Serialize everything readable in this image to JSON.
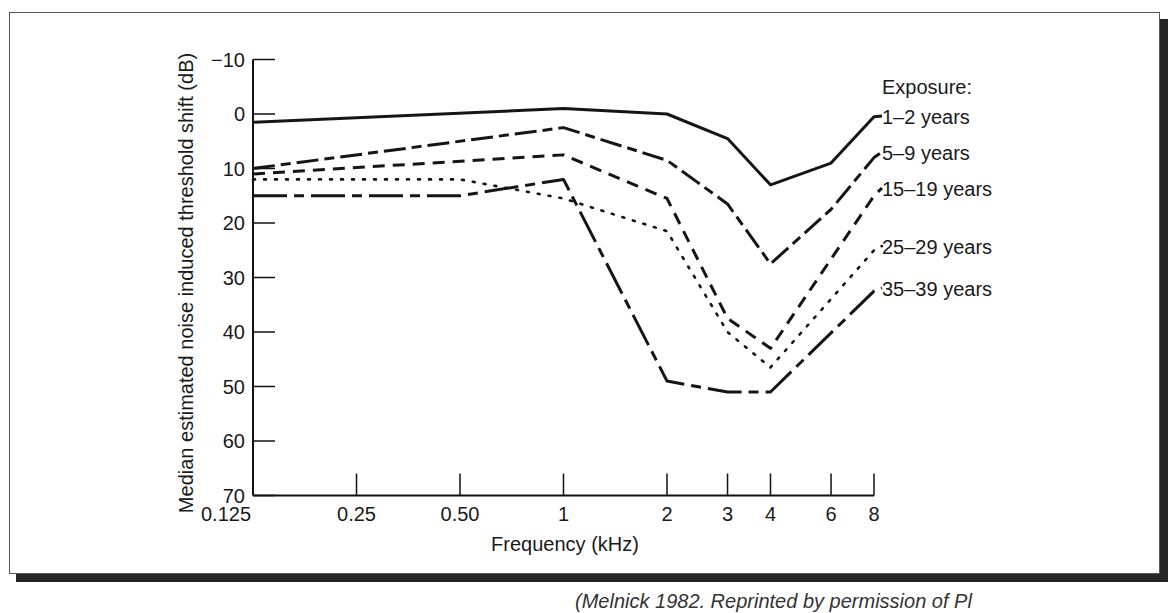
{
  "figure": {
    "title_partial": "Figure: Hearing loss versus years of exposure to noise — noise-induced hearing loss",
    "caption_partial": "(Melnick 1982. Reprinted by permission of Pl"
  },
  "chart_data": {
    "type": "line",
    "title": "",
    "xlabel": "Frequency (kHz)",
    "ylabel": "Median estimated noise induced threshold shift (dB)",
    "x_scale": "log",
    "x": [
      0.125,
      0.25,
      0.5,
      1,
      2,
      3,
      4,
      6,
      8
    ],
    "x_tick_labels": [
      "0.125",
      "0.25",
      "0.50",
      "1",
      "2",
      "3",
      "4",
      "6",
      "8"
    ],
    "y_ticks": [
      -10,
      0,
      10,
      20,
      30,
      40,
      50,
      60,
      70
    ],
    "y_tick_labels": [
      "−10",
      "0",
      "10",
      "20",
      "30",
      "40",
      "50",
      "60",
      "70"
    ],
    "ylim": [
      70,
      -10
    ],
    "y_inverted": true,
    "grid": false,
    "legend_title": "Exposure:",
    "legend_position": "right",
    "series": [
      {
        "name": "1–2 years",
        "style": "solid",
        "points": [
          [
            0.125,
            1.5
          ],
          [
            1,
            -1
          ],
          [
            2,
            0
          ],
          [
            3,
            4.5
          ],
          [
            4,
            13
          ],
          [
            6,
            9
          ],
          [
            8,
            0.5
          ]
        ]
      },
      {
        "name": "5–9 years",
        "style": "dash-dot",
        "points": [
          [
            0.125,
            10
          ],
          [
            1,
            2.5
          ],
          [
            2,
            8.5
          ],
          [
            3,
            16.5
          ],
          [
            4,
            27.5
          ],
          [
            6,
            17.5
          ],
          [
            8,
            8
          ]
        ]
      },
      {
        "name": "15–19 years",
        "style": "dashed",
        "points": [
          [
            0.125,
            11
          ],
          [
            1,
            7.5
          ],
          [
            2,
            15.5
          ],
          [
            3,
            37.5
          ],
          [
            4,
            43
          ],
          [
            8,
            15
          ]
        ]
      },
      {
        "name": "25–29 years",
        "style": "dotted",
        "points": [
          [
            0.125,
            12
          ],
          [
            0.5,
            12
          ],
          [
            1,
            15.5
          ],
          [
            2,
            21.5
          ],
          [
            3,
            40
          ],
          [
            4,
            46.5
          ],
          [
            8,
            25
          ]
        ]
      },
      {
        "name": "35–39 years",
        "style": "long-dash",
        "points": [
          [
            0.125,
            15
          ],
          [
            0.5,
            15
          ],
          [
            1,
            12
          ],
          [
            2,
            49
          ],
          [
            3,
            51
          ],
          [
            4,
            51
          ],
          [
            8,
            32.5
          ]
        ]
      }
    ]
  }
}
